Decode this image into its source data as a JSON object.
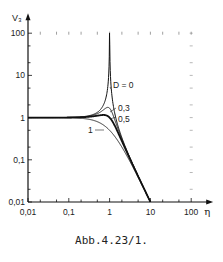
{
  "chart_data": {
    "type": "line",
    "title": "",
    "caption": "Abb.4.23/1.",
    "xlabel": "η",
    "ylabel": "V₃",
    "xscale": "log",
    "yscale": "log",
    "xlim": [
      0.01,
      100
    ],
    "ylim": [
      0.01,
      100
    ],
    "x_ticks": [
      "0,01",
      "0,1",
      "1",
      "10",
      "100"
    ],
    "y_ticks": [
      "0,01",
      "0,1",
      "1",
      "10",
      "100"
    ],
    "grid": false,
    "legend": "inline labels near curves",
    "formula": "V3 = 1 / sqrt((1-η²)² + (2Dη)²)",
    "series": [
      {
        "name": "D = 0",
        "label": "D = 0",
        "D": 0,
        "x": [
          0.01,
          0.1,
          0.3,
          0.5,
          0.8,
          0.95,
          1.0,
          1.05,
          1.2,
          2,
          3,
          5,
          10
        ],
        "y": [
          1.0,
          1.01,
          1.1,
          1.33,
          2.78,
          10.3,
          100,
          9.76,
          2.27,
          0.33,
          0.125,
          0.042,
          0.0101
        ]
      },
      {
        "name": "D = 0,3",
        "label": "0,3",
        "D": 0.3,
        "x": [
          0.01,
          0.1,
          0.3,
          0.5,
          0.8,
          1.0,
          1.2,
          2,
          3,
          5,
          10
        ],
        "y": [
          1.0,
          1.01,
          1.08,
          1.2,
          1.58,
          1.67,
          1.18,
          0.31,
          0.122,
          0.041,
          0.0101
        ]
      },
      {
        "name": "D = 0,5",
        "label": "0,5",
        "D": 0.5,
        "x": [
          0.01,
          0.1,
          0.3,
          0.5,
          0.7,
          0.8,
          1.0,
          1.2,
          2,
          3,
          5,
          10
        ],
        "y": [
          1.0,
          1.0,
          1.04,
          1.07,
          1.09,
          1.07,
          1.0,
          0.77,
          0.277,
          0.118,
          0.041,
          0.0101
        ]
      },
      {
        "name": "D = 1",
        "label": "1",
        "D": 1,
        "x": [
          0.01,
          0.1,
          0.3,
          0.5,
          0.8,
          1.0,
          1.2,
          2,
          3,
          5,
          10
        ],
        "y": [
          1.0,
          0.99,
          0.92,
          0.8,
          0.61,
          0.5,
          0.41,
          0.2,
          0.1,
          0.038,
          0.0099
        ]
      }
    ],
    "colors": {
      "line": "#111111",
      "axis": "#111111",
      "background": "#ffffff"
    }
  },
  "caption": "Abb.4.23/1."
}
